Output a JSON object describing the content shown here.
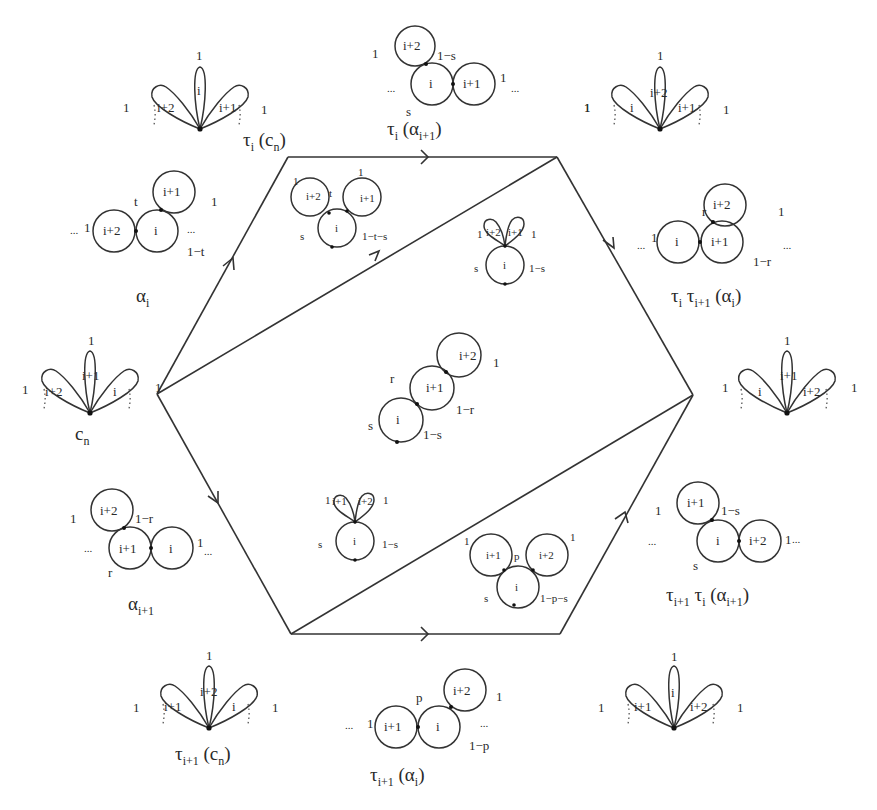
{
  "figure": {
    "hexagon": {
      "vertices": [
        [
          157,
          394
        ],
        [
          288,
          157
        ],
        [
          557,
          157
        ],
        [
          693,
          395
        ],
        [
          560,
          634
        ],
        [
          291,
          634
        ]
      ],
      "diagonals": [
        [
          [
            157,
            394
          ],
          [
            557,
            157
          ]
        ],
        [
          [
            291,
            634
          ],
          [
            693,
            395
          ]
        ]
      ]
    },
    "captions": {
      "tau_i_cn": {
        "main": "τ",
        "sub": "i",
        "rest": " (c",
        "sub2": "n",
        "end": ")"
      },
      "tau_i_alpha_i1": {
        "main": "τ",
        "sub": "i",
        "rest": " (α",
        "sub2": "i+1",
        "end": ")"
      },
      "alpha_i": {
        "main": "α",
        "sub": "i"
      },
      "tau_i_tau_i1_alpha_i": {
        "main": "τ",
        "sub": "i",
        "mid": " τ",
        "sub_mid": "i+1",
        "rest": " (α",
        "sub2": "i",
        "end": ")"
      },
      "c_n": {
        "main": "c",
        "sub": "n"
      },
      "alpha_i1": {
        "main": "α",
        "sub": "i+1"
      },
      "tau_i1_tau_i_alpha_i1": {
        "main": "τ",
        "sub": "i+1",
        "mid": " τ",
        "sub_mid": "i",
        "rest": " (α",
        "sub2": "i+1",
        "end": ")"
      },
      "tau_i1_cn": {
        "main": "τ",
        "sub": "i+1",
        "rest": " (c",
        "sub2": "n",
        "end": ")"
      },
      "tau_i1_alpha_i": {
        "main": "τ",
        "sub": "i+1",
        "rest": " (α",
        "sub2": "i",
        "end": ")"
      }
    },
    "labels": {
      "one": "1",
      "i": "i",
      "i1": "i+1",
      "i2": "i+2",
      "ellipsis": "...",
      "s": "s",
      "t": "t",
      "r": "r",
      "p": "p",
      "one_minus_s": "1−s",
      "one_minus_t": "1−t",
      "one_minus_r": "1−r",
      "one_minus_p": "1−p",
      "one_minus_t_minus_s": "1−t−s",
      "one_minus_p_minus_s": "1−p−s"
    }
  }
}
